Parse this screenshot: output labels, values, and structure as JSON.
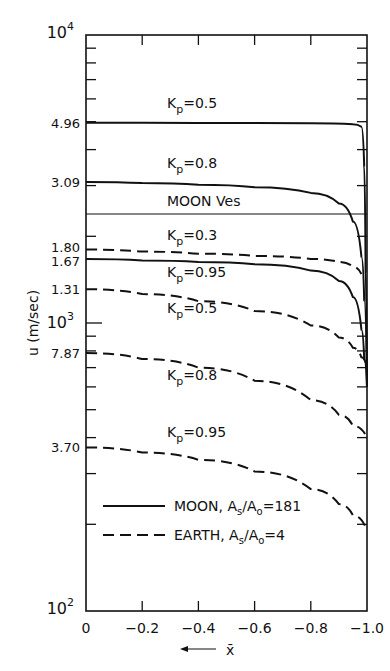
{
  "chart_data": {
    "type": "line",
    "title": "",
    "xlabel": "x̄",
    "xlabel_arrow": "←",
    "ylabel": "u (m/sec)",
    "yscale": "log",
    "xlim": [
      0,
      -1.0
    ],
    "ylim": [
      100,
      10000
    ],
    "grid": false,
    "legend_position": "lower-left inside plot",
    "x_ticks": [
      "0",
      "-0.2",
      "-0.4",
      "-0.6",
      "-0.8",
      "-1.0"
    ],
    "y_tick_labels": [
      {
        "label": "10",
        "sup": "4",
        "value": 10000
      },
      {
        "label": "4.96",
        "value": 4960
      },
      {
        "label": "3.09",
        "value": 3090
      },
      {
        "label": "1.80",
        "value": 1800
      },
      {
        "label": "1.67",
        "value": 1670
      },
      {
        "label": "1.31",
        "value": 1310
      },
      {
        "label": "10",
        "sup": "3",
        "value": 1000
      },
      {
        "label": "7.87",
        "value": 787
      },
      {
        "label": "3.70",
        "value": 370
      },
      {
        "label": "10",
        "sup": "2",
        "value": 100
      }
    ],
    "reference_lines": [
      {
        "name": "MOON Ves",
        "value": 2380,
        "style": "thin-solid"
      }
    ],
    "legend": [
      {
        "name": "MOON, As/Ao=181",
        "style": "solid"
      },
      {
        "name": "EARTH, As/Ao=4",
        "style": "dashed"
      }
    ],
    "series": [
      {
        "name": "MOON Kp=0.5",
        "group": "MOON",
        "style": "solid",
        "label_text": "Kp=0.5",
        "x": [
          0,
          -0.2,
          -0.4,
          -0.6,
          -0.8,
          -0.95,
          -0.98,
          -0.99,
          -0.995,
          -1.0
        ],
        "y": [
          4960,
          4955,
          4950,
          4945,
          4935,
          4900,
          4800,
          3500,
          1500,
          600
        ]
      },
      {
        "name": "MOON Kp=0.8",
        "group": "MOON",
        "style": "solid",
        "label_text": "Kp=0.8",
        "x": [
          0,
          -0.2,
          -0.4,
          -0.6,
          -0.8,
          -0.9,
          -0.95,
          -0.98,
          -0.99,
          -1.0
        ],
        "y": [
          3090,
          3060,
          3020,
          2960,
          2830,
          2600,
          2250,
          1700,
          1200,
          600
        ]
      },
      {
        "name": "MOON Kp=0.95",
        "group": "MOON",
        "style": "solid",
        "label_text": "Kp=0.95",
        "x": [
          0,
          -0.2,
          -0.4,
          -0.6,
          -0.8,
          -0.9,
          -0.95,
          -0.98,
          -0.99,
          -1.0
        ],
        "y": [
          1670,
          1650,
          1630,
          1600,
          1520,
          1400,
          1230,
          950,
          750,
          600
        ]
      },
      {
        "name": "EARTH Kp=0.3",
        "group": "EARTH",
        "style": "dashed",
        "label_text": "Kp=0.3",
        "x": [
          0,
          -0.2,
          -0.4,
          -0.6,
          -0.8,
          -0.9,
          -0.95,
          -0.98
        ],
        "y": [
          1800,
          1770,
          1740,
          1710,
          1670,
          1630,
          1570,
          1480
        ]
      },
      {
        "name": "EARTH Kp=0.5",
        "group": "EARTH",
        "style": "dashed",
        "label_text": "Kp=0.5",
        "x": [
          0,
          -0.2,
          -0.4,
          -0.6,
          -0.8,
          -0.9,
          -0.95,
          -0.98,
          -1.0
        ],
        "y": [
          1310,
          1260,
          1190,
          1100,
          980,
          890,
          820,
          760,
          700
        ]
      },
      {
        "name": "EARTH Kp=0.8",
        "group": "EARTH",
        "style": "dashed",
        "label_text": "Kp=0.8",
        "x": [
          0,
          -0.2,
          -0.4,
          -0.6,
          -0.8,
          -0.9,
          -0.95,
          -1.0
        ],
        "y": [
          787,
          750,
          700,
          630,
          540,
          480,
          440,
          400
        ]
      },
      {
        "name": "EARTH Kp=0.95",
        "group": "EARTH",
        "style": "dashed",
        "label_text": "Kp=0.95",
        "x": [
          0,
          -0.2,
          -0.4,
          -0.6,
          -0.8,
          -0.9,
          -0.95,
          -1.0
        ],
        "y": [
          370,
          355,
          335,
          305,
          265,
          235,
          215,
          190
        ]
      }
    ],
    "annotations": [
      {
        "text": "Kp=0.5",
        "near": "MOON Kp=0.5"
      },
      {
        "text": "Kp=0.8",
        "near": "MOON Kp=0.8"
      },
      {
        "text": "MOON Ves",
        "near": "reference line"
      },
      {
        "text": "Kp=0.3",
        "near": "EARTH Kp=0.3"
      },
      {
        "text": "Kp=0.95",
        "near": "MOON Kp=0.95"
      },
      {
        "text": "Kp=0.5",
        "near": "EARTH Kp=0.5"
      },
      {
        "text": "Kp=0.8",
        "near": "EARTH Kp=0.8"
      },
      {
        "text": "Kp=0.95",
        "near": "EARTH Kp=0.95"
      }
    ]
  },
  "labels": {
    "y_axis": "u (m/sec)",
    "x_axis": "x̄",
    "moon_ves": "MOON Ves",
    "kp_prefix": "K",
    "kp_sub": "p",
    "legend_moon": "MOON, A",
    "legend_moon_tail": "=181",
    "legend_earth": "EARTH, A",
    "legend_earth_tail": "=4",
    "sub_s": "s",
    "sub_o": "o",
    "slash_a": "/A"
  }
}
